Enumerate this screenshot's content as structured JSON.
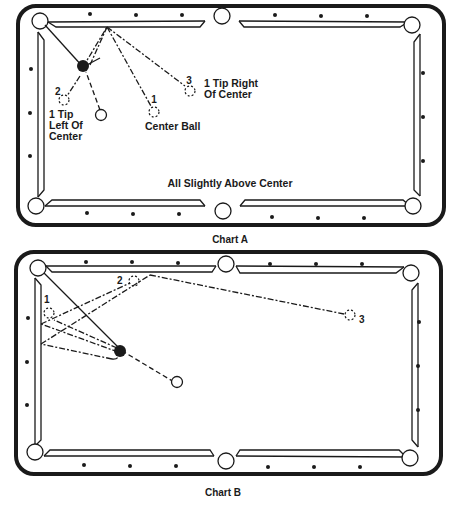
{
  "chart_a": {
    "caption": "Chart A",
    "note": "All Slightly Above Center",
    "labels": {
      "ball_1_num": "1",
      "ball_1_desc": "Center Ball",
      "ball_2_num": "2",
      "ball_2_desc_1": "1 Tip",
      "ball_2_desc_2": "Left Of",
      "ball_2_desc_3": "Center",
      "ball_3_num": "3",
      "ball_3_desc_1": "1 Tip Right",
      "ball_3_desc_2": "Of Center"
    }
  },
  "chart_b": {
    "caption": "Chart B",
    "labels": {
      "ball_1_num": "1",
      "ball_2_num": "2",
      "ball_3_num": "3"
    }
  },
  "colors": {
    "ink": "#1a1a1a",
    "background": "#ffffff"
  }
}
